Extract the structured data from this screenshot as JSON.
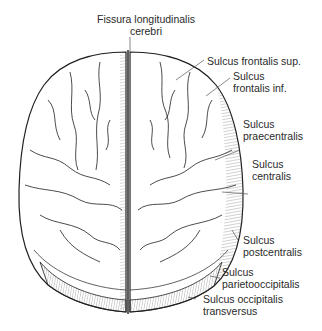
{
  "figure": {
    "labels": [
      {
        "id": "fissura",
        "line1": "Fissura longitudinalis",
        "line2": "cerebri"
      },
      {
        "id": "front-sup",
        "line1": "Sulcus frontalis sup.",
        "line2": ""
      },
      {
        "id": "front-inf",
        "line1": "Sulcus",
        "line2": "frontalis inf."
      },
      {
        "id": "praecentralis",
        "line1": "Sulcus",
        "line2": "praecentralis"
      },
      {
        "id": "centralis",
        "line1": "Sulcus",
        "line2": "centralis"
      },
      {
        "id": "postcentralis",
        "line1": "Sulcus",
        "line2": "postcentralis"
      },
      {
        "id": "parietooccipitalis",
        "line1": "Sulcus",
        "line2": "parietooccipitalis"
      },
      {
        "id": "occ-transversus",
        "line1": "Sulcus occipitalis",
        "line2": "transversus"
      }
    ]
  },
  "colors": {
    "line": "#1e1e1e",
    "leader": "#555555",
    "hatch": "#777777",
    "text": "#2a2a2a"
  }
}
